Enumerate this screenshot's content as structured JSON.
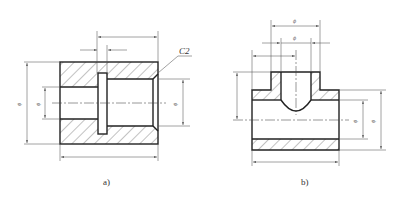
{
  "figures": [
    {
      "id": "a",
      "caption": "a)",
      "description": "Sectioned sleeve with internal groove and chamfer",
      "annotations": {
        "chamfer": "C2",
        "dim_outer_dia": "ϕ",
        "dim_left_bore": "ϕ",
        "dim_right_bore": "ϕ"
      }
    },
    {
      "id": "b",
      "caption": "b)",
      "description": "Sectioned tee fitting with branch boss",
      "annotations": {
        "dim_boss_outer": "ϕ",
        "dim_boss_inner": "ϕ",
        "dim_main_bore": "ϕ",
        "dim_main_outer": "ϕ"
      }
    }
  ],
  "colors": {
    "line": "#222222",
    "dimension": "#555555",
    "background": "#ffffff"
  }
}
